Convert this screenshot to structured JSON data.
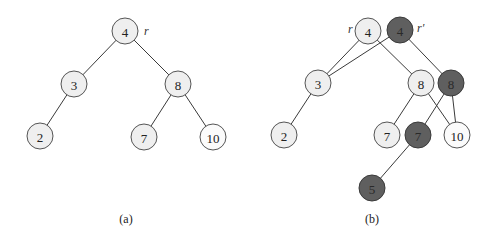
{
  "diagram_a": {
    "caption": "(a)",
    "root_label": "r",
    "nodes": [
      {
        "id": "a4",
        "label": "4",
        "x": 125,
        "y": 31,
        "style": "light"
      },
      {
        "id": "a3",
        "label": "3",
        "x": 74,
        "y": 84,
        "style": "light"
      },
      {
        "id": "a8",
        "label": "8",
        "x": 178,
        "y": 84,
        "style": "light"
      },
      {
        "id": "a2",
        "label": "2",
        "x": 40,
        "y": 136,
        "style": "light"
      },
      {
        "id": "a7",
        "label": "7",
        "x": 144,
        "y": 137,
        "style": "light"
      },
      {
        "id": "a10",
        "label": "10",
        "x": 213,
        "y": 137,
        "style": "white"
      }
    ],
    "edges": [
      [
        "a4",
        "a3"
      ],
      [
        "a4",
        "a8"
      ],
      [
        "a3",
        "a2"
      ],
      [
        "a8",
        "a7"
      ],
      [
        "a8",
        "a10"
      ]
    ]
  },
  "diagram_b": {
    "caption": "(b)",
    "root_label": "r",
    "new_root_label": "r′",
    "nodes": [
      {
        "id": "b4",
        "label": "4",
        "x": 368,
        "y": 31,
        "style": "light"
      },
      {
        "id": "b4n",
        "label": "4",
        "x": 400,
        "y": 30,
        "style": "dark"
      },
      {
        "id": "b3",
        "label": "3",
        "x": 318,
        "y": 83,
        "style": "light"
      },
      {
        "id": "b8",
        "label": "8",
        "x": 421,
        "y": 83,
        "style": "light"
      },
      {
        "id": "b8n",
        "label": "8",
        "x": 451,
        "y": 83,
        "style": "dark"
      },
      {
        "id": "b2",
        "label": "2",
        "x": 284,
        "y": 135,
        "style": "light"
      },
      {
        "id": "b7",
        "label": "7",
        "x": 387,
        "y": 135,
        "style": "light"
      },
      {
        "id": "b7n",
        "label": "7",
        "x": 418,
        "y": 135,
        "style": "dark"
      },
      {
        "id": "b10",
        "label": "10",
        "x": 457,
        "y": 135,
        "style": "white"
      },
      {
        "id": "b5n",
        "label": "5",
        "x": 372,
        "y": 188,
        "style": "dark"
      }
    ],
    "edges": [
      [
        "b4",
        "b3"
      ],
      [
        "b4",
        "b8"
      ],
      [
        "b4n",
        "b3"
      ],
      [
        "b4n",
        "b8n"
      ],
      [
        "b3",
        "b2"
      ],
      [
        "b8",
        "b7"
      ],
      [
        "b8",
        "b10"
      ],
      [
        "b8n",
        "b7n"
      ],
      [
        "b8n",
        "b10"
      ],
      [
        "b7n",
        "b5n"
      ]
    ]
  },
  "colors": {
    "light_fill": "#efefef",
    "dark_fill": "#5f5f5f",
    "stroke": "#555555"
  }
}
